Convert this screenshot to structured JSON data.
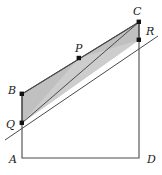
{
  "figure": {
    "type": "geometry-diagram",
    "background_color": "#ffffff",
    "stroke_color": "#3a3a3a",
    "shade_fill": "#b9b9b9",
    "shade_fill_light": "#c9c9c9",
    "point_color": "#111111",
    "canvas": {
      "width": 162,
      "height": 175
    },
    "labels": {
      "A": "A",
      "B": "B",
      "C": "C",
      "D": "D",
      "P": "P",
      "Q": "Q",
      "R": "R"
    },
    "points": {
      "A": {
        "x": 22,
        "y": 158
      },
      "B": {
        "x": 22,
        "y": 94
      },
      "C": {
        "x": 139,
        "y": 22
      },
      "D": {
        "x": 139,
        "y": 158
      },
      "P": {
        "x": 79,
        "y": 58
      },
      "Q": {
        "x": 22,
        "y": 123
      },
      "R": {
        "x": 139,
        "y": 40
      }
    },
    "label_positions": {
      "A": {
        "x": 9,
        "y": 160
      },
      "B": {
        "x": 9,
        "y": 93
      },
      "C": {
        "x": 134,
        "y": 14
      },
      "D": {
        "x": 148,
        "y": 160
      },
      "P": {
        "x": 76,
        "y": 51
      },
      "Q": {
        "x": 8,
        "y": 126
      },
      "R": {
        "x": 146,
        "y": 33
      }
    },
    "outline_polygon": "22,158 22,94 139,22 139,158",
    "shaded_quad": "22,94 139,22 139,40 22,123",
    "line_QC": {
      "x1": 22,
      "y1": 123,
      "x2": 139,
      "y2": 22
    },
    "line_through_QR": {
      "x1": 5,
      "y1": 140,
      "x2": 158,
      "y2": 36
    },
    "segment_BQ": {
      "x1": 22,
      "y1": 94,
      "x2": 22,
      "y2": 123
    },
    "segment_CR": {
      "x1": 139,
      "y1": 22,
      "x2": 139,
      "y2": 40
    },
    "marked_points": [
      "B",
      "C",
      "P",
      "Q",
      "R"
    ]
  }
}
